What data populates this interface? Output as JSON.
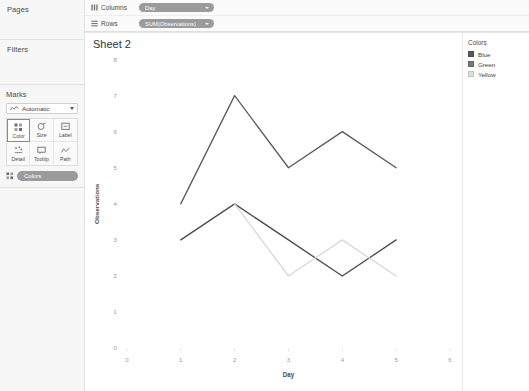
{
  "sidebar": {
    "pages": {
      "title": "Pages"
    },
    "filters": {
      "title": "Filters"
    },
    "marks": {
      "title": "Marks",
      "mark_type": "Automatic",
      "mark_type_icon": "line-chart-icon",
      "buttons": [
        {
          "label": "Color",
          "icon": "color-icon",
          "selected": true
        },
        {
          "label": "Size",
          "icon": "size-icon",
          "selected": false
        },
        {
          "label": "Label",
          "icon": "label-icon",
          "selected": false
        },
        {
          "label": "Detail",
          "icon": "detail-icon",
          "selected": false
        },
        {
          "label": "Tooltip",
          "icon": "tooltip-icon",
          "selected": false
        },
        {
          "label": "Path",
          "icon": "path-icon",
          "selected": false
        }
      ],
      "encoding_pills": [
        {
          "label": "Colors",
          "icon": "color-icon"
        }
      ]
    }
  },
  "shelves": {
    "columns": {
      "label": "Columns",
      "icon": "columns-icon",
      "pill": "Day"
    },
    "rows": {
      "label": "Rows",
      "icon": "rows-icon",
      "pill": "SUM(Observations)"
    }
  },
  "worksheet": {
    "title": "Sheet 2"
  },
  "legend": {
    "title": "Colors",
    "items": [
      {
        "label": "Blue",
        "color": "#595959"
      },
      {
        "label": "Green",
        "color": "#777777"
      },
      {
        "label": "Yellow",
        "color": "#dedede"
      }
    ]
  },
  "chart_data": {
    "type": "line",
    "title": "Sheet 2",
    "xlabel": "Day",
    "ylabel": "Observations",
    "xlim": [
      0,
      6
    ],
    "ylim": [
      0,
      8
    ],
    "xticks": [
      0,
      1,
      2,
      3,
      4,
      5,
      6
    ],
    "yticks": [
      0,
      1,
      2,
      3,
      4,
      5,
      6,
      7,
      8
    ],
    "grid": false,
    "legend_position": "right",
    "series": [
      {
        "name": "Blue",
        "color": "#595959",
        "x": [
          1,
          2,
          3,
          4,
          5
        ],
        "values": [
          4,
          7,
          5,
          6,
          5
        ]
      },
      {
        "name": "Green",
        "color": "#4a4a4a",
        "x": [
          1,
          2,
          3,
          4,
          5
        ],
        "values": [
          3,
          4,
          3,
          2,
          3
        ]
      },
      {
        "name": "Yellow",
        "color": "#d8d8d8",
        "x": [
          2,
          3,
          4,
          5
        ],
        "values": [
          4,
          2,
          3,
          2
        ]
      }
    ]
  }
}
